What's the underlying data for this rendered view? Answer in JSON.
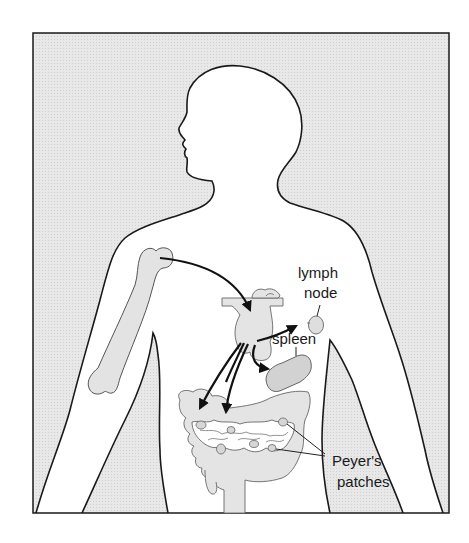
{
  "diagram": {
    "type": "anatomical illustration",
    "colors": {
      "background_fill": "#e6e6e6",
      "body_fill": "#ffffff",
      "organ_fill": "#e4e4e4",
      "spleen_fill": "#d3d3d3",
      "outline": "#1a1a1a",
      "arrow": "#111111"
    },
    "labels": {
      "lymph_node": [
        "lymph",
        "node"
      ],
      "spleen": "spleen",
      "peyers_patches": [
        "Peyer's",
        "patches"
      ]
    },
    "structures": [
      {
        "name": "bone marrow (humerus)",
        "labeled": false
      },
      {
        "name": "thymus",
        "labeled": false
      },
      {
        "name": "lymph node",
        "labeled": true
      },
      {
        "name": "spleen",
        "labeled": true
      },
      {
        "name": "intestines",
        "labeled": false
      },
      {
        "name": "Peyer's patches",
        "labeled": true
      }
    ],
    "arrows": [
      {
        "from": "bone marrow",
        "to": "thymus"
      },
      {
        "from": "thymus",
        "to": "lymph node"
      },
      {
        "from": "thymus",
        "to": "spleen"
      },
      {
        "from": "thymus",
        "to": "intestines (left)"
      },
      {
        "from": "thymus",
        "to": "intestines (center)"
      }
    ]
  }
}
